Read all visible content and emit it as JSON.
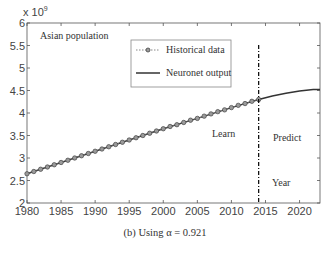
{
  "chart_data": {
    "type": "line",
    "title": "Asian population",
    "xlabel": "Year",
    "ylabel": "",
    "y_multiplier": "x 10^9",
    "xlim": [
      1980,
      2023
    ],
    "ylim": [
      2,
      6
    ],
    "x_ticks": [
      1980,
      1985,
      1990,
      1995,
      2000,
      2005,
      2010,
      2015,
      2020
    ],
    "y_ticks": [
      2,
      2.5,
      3,
      3.5,
      4,
      4.5,
      5,
      5.5,
      6
    ],
    "grid": false,
    "legend_position": "upper-center",
    "annotations": [
      "Learn",
      "Predict",
      "Year"
    ],
    "split_year": 2014,
    "series": [
      {
        "name": "Historical data",
        "style": "dotted-circle-markers",
        "x": [
          1980,
          1981,
          1982,
          1983,
          1984,
          1985,
          1986,
          1987,
          1988,
          1989,
          1990,
          1991,
          1992,
          1993,
          1994,
          1995,
          1996,
          1997,
          1998,
          1999,
          2000,
          2001,
          2002,
          2003,
          2004,
          2005,
          2006,
          2007,
          2008,
          2009,
          2010,
          2011,
          2012,
          2013,
          2014
        ],
        "values": [
          2.65,
          2.7,
          2.75,
          2.8,
          2.85,
          2.9,
          2.95,
          3.0,
          3.05,
          3.1,
          3.15,
          3.2,
          3.25,
          3.3,
          3.35,
          3.4,
          3.45,
          3.5,
          3.55,
          3.6,
          3.65,
          3.7,
          3.74,
          3.79,
          3.84,
          3.88,
          3.93,
          3.98,
          4.03,
          4.07,
          4.12,
          4.17,
          4.21,
          4.26,
          4.3
        ]
      },
      {
        "name": "Neuronet output",
        "style": "solid",
        "x": [
          1980,
          1985,
          1990,
          1995,
          2000,
          2005,
          2010,
          2014,
          2016,
          2018,
          2020,
          2022,
          2023
        ],
        "values": [
          2.65,
          2.9,
          3.15,
          3.4,
          3.65,
          3.88,
          4.12,
          4.3,
          4.38,
          4.44,
          4.49,
          4.52,
          4.52
        ]
      }
    ]
  },
  "labels": {
    "multiplier_base": "x 10",
    "multiplier_exp": "9",
    "title": "Asian population",
    "legend_historical": "Historical data",
    "legend_neuronet": "Neuronet output",
    "learn": "Learn",
    "predict": "Predict",
    "year": "Year",
    "caption": "(b) Using α = 0.921"
  },
  "colors": {
    "line": "#333333",
    "marker_fill": "#9a9a9a",
    "axis": "#555555",
    "split_line": "#000000"
  }
}
